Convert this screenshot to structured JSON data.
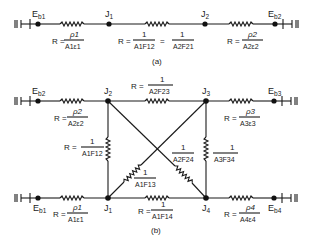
{
  "diagram_a": {
    "caption": "(a)",
    "nodes": {
      "eb1": {
        "label": "E",
        "sub": "b1"
      },
      "j1": {
        "label": "J",
        "sub": "1"
      },
      "j2": {
        "label": "J",
        "sub": "2"
      },
      "eb2": {
        "label": "E",
        "sub": "b2"
      }
    },
    "resistances": {
      "r1": {
        "prefix": "R =",
        "num": "ρ1",
        "den": "A1ε1"
      },
      "r12": {
        "prefix": "R =",
        "num": "1",
        "den": "A1F12",
        "eq": "=",
        "num2": "1",
        "den2": "A2F21"
      },
      "r2": {
        "prefix": "R =",
        "num": "ρ2",
        "den": "A2ε2"
      }
    }
  },
  "diagram_b": {
    "caption": "(b)",
    "nodes": {
      "eb2": {
        "label": "E",
        "sub": "b2"
      },
      "j2": {
        "label": "J",
        "sub": "2"
      },
      "j3": {
        "label": "J",
        "sub": "3"
      },
      "eb3": {
        "label": "E",
        "sub": "b3"
      },
      "eb1": {
        "label": "E",
        "sub": "b1"
      },
      "j1": {
        "label": "J",
        "sub": "1"
      },
      "j4": {
        "label": "J",
        "sub": "4"
      },
      "eb4": {
        "label": "E",
        "sub": "b4"
      }
    },
    "resistances": {
      "r2": {
        "prefix": "R =",
        "num": "ρ2",
        "den": "A2ε2"
      },
      "r23": {
        "prefix": "R =",
        "num": "1",
        "den": "A2F23"
      },
      "r3": {
        "prefix": "R =",
        "num": "ρ3",
        "den": "A3ε3"
      },
      "r12": {
        "prefix": "R =",
        "num": "1",
        "den": "A1F12"
      },
      "r24": {
        "num": "1",
        "den": "A2F24"
      },
      "r34": {
        "num": "1",
        "den": "A3F34"
      },
      "r13": {
        "num": "1",
        "den": "A1F13"
      },
      "r1": {
        "prefix": "R =",
        "num": "ρ1",
        "den": "A1ε1"
      },
      "r14": {
        "prefix": "R =",
        "num": "1",
        "den": "A1F14"
      },
      "r4": {
        "prefix": "R =",
        "num": "ρ4",
        "den": "A4ε4"
      }
    }
  }
}
